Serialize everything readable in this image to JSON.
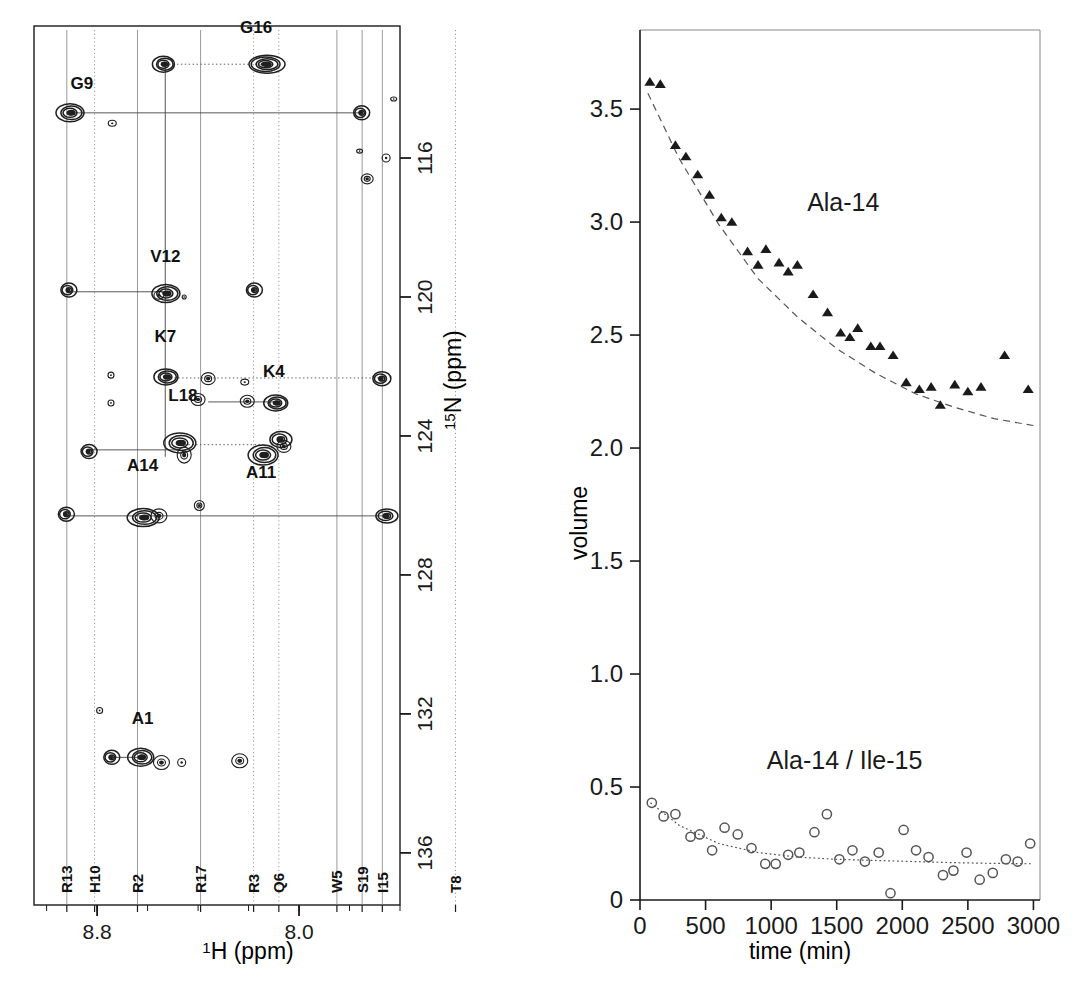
{
  "figure": {
    "background_color": "#ffffff",
    "ink_color": "#1a1a1a"
  },
  "nmr_panel": {
    "name": "2D 1H-15N HSQC spectrum",
    "x_axis": {
      "label_main": "H (ppm)",
      "label_superscript": "1",
      "ticks_major": [
        8.8,
        8.0
      ],
      "tick_labels": [
        "8.8",
        "8.0"
      ],
      "range": [
        9.05,
        7.6
      ],
      "direction": "reversed"
    },
    "y_axis": {
      "label_main": "N (ppm)",
      "label_superscript": "15",
      "ticks_major": [
        116,
        120,
        124,
        128,
        132,
        136
      ],
      "tick_labels": [
        "116",
        "120",
        "124",
        "128",
        "132",
        "136"
      ],
      "range": [
        112.2,
        137.5
      ],
      "direction": "reversed"
    },
    "peak_labels": [
      {
        "text": "G9",
        "h": 8.86,
        "n": 114.0
      },
      {
        "text": "G16",
        "h": 8.17,
        "n": 112.4
      },
      {
        "text": "V12",
        "h": 8.53,
        "n": 119.0
      },
      {
        "text": "K7",
        "h": 8.53,
        "n": 121.3
      },
      {
        "text": "K4",
        "h": 8.1,
        "n": 122.3
      },
      {
        "text": "L18",
        "h": 8.46,
        "n": 123.0
      },
      {
        "text": "A11",
        "h": 8.15,
        "n": 125.2
      },
      {
        "text": "A14",
        "h": 8.62,
        "n": 125.0
      },
      {
        "text": "A1",
        "h": 8.62,
        "n": 132.3
      }
    ],
    "residue_ticks": [
      {
        "label": "R13",
        "h": 8.92
      },
      {
        "label": "H10",
        "h": 8.81
      },
      {
        "label": "R2",
        "h": 8.64
      },
      {
        "label": "R17",
        "h": 8.39
      },
      {
        "label": "R3",
        "h": 8.18
      },
      {
        "label": "Q6",
        "h": 8.08
      },
      {
        "label": "W5",
        "h": 7.85
      },
      {
        "label": "S19",
        "h": 7.75
      },
      {
        "label": "I15",
        "h": 7.67
      },
      {
        "label": "T8",
        "h": 7.38
      }
    ],
    "cross_peaks": [
      {
        "id": "G9",
        "h": 8.905,
        "n": 114.7,
        "rx": 14,
        "ry": 9,
        "rings": 4
      },
      {
        "id": "G9-pair",
        "h": 8.535,
        "n": 113.3,
        "rx": 11,
        "ry": 8,
        "rings": 4
      },
      {
        "id": "G16",
        "h": 8.13,
        "n": 113.3,
        "rx": 18,
        "ry": 9,
        "rings": 5
      },
      {
        "id": "G16-pair",
        "h": 7.755,
        "n": 114.7,
        "rx": 8,
        "ry": 7,
        "rings": 3
      },
      {
        "id": "aux-1",
        "h": 8.74,
        "n": 115.0,
        "rx": 4,
        "ry": 3,
        "rings": 1
      },
      {
        "id": "aux-2",
        "h": 7.73,
        "n": 116.6,
        "rx": 6,
        "ry": 5,
        "rings": 2
      },
      {
        "id": "aux-3",
        "h": 7.76,
        "n": 115.8,
        "rx": 3,
        "ry": 2,
        "rings": 1
      },
      {
        "id": "aux-4",
        "h": 7.655,
        "n": 116.0,
        "rx": 4,
        "ry": 4,
        "rings": 1
      },
      {
        "id": "aux-5",
        "h": 7.625,
        "n": 114.3,
        "rx": 3,
        "ry": 2,
        "rings": 1
      },
      {
        "id": "V12",
        "h": 8.525,
        "n": 119.9,
        "rx": 14,
        "ry": 9,
        "rings": 4
      },
      {
        "id": "V12-pair",
        "h": 8.915,
        "n": 119.8,
        "rx": 8,
        "ry": 7,
        "rings": 3
      },
      {
        "id": "V12-aux",
        "h": 8.555,
        "n": 119.95,
        "rx": 5,
        "ry": 4,
        "rings": 1
      },
      {
        "id": "aux-6",
        "h": 8.18,
        "n": 119.8,
        "rx": 8,
        "ry": 7,
        "rings": 3
      },
      {
        "id": "aux-7",
        "h": 8.455,
        "n": 120.0,
        "rx": 2,
        "ry": 2,
        "rings": 1
      },
      {
        "id": "K7",
        "h": 8.525,
        "n": 122.3,
        "rx": 12,
        "ry": 8,
        "rings": 4
      },
      {
        "id": "K7-b",
        "h": 8.36,
        "n": 122.35,
        "rx": 7,
        "ry": 6,
        "rings": 2
      },
      {
        "id": "K7-c",
        "h": 8.215,
        "n": 122.45,
        "rx": 4,
        "ry": 3,
        "rings": 1
      },
      {
        "id": "K7-d",
        "h": 7.675,
        "n": 122.35,
        "rx": 9,
        "ry": 7,
        "rings": 3
      },
      {
        "id": "aux-8",
        "h": 8.745,
        "n": 122.25,
        "rx": 3,
        "ry": 3,
        "rings": 1
      },
      {
        "id": "aux-9",
        "h": 8.745,
        "n": 123.05,
        "rx": 3,
        "ry": 3,
        "rings": 1
      },
      {
        "id": "K4",
        "h": 8.09,
        "n": 123.05,
        "rx": 12,
        "ry": 8,
        "rings": 4
      },
      {
        "id": "K4-b",
        "h": 8.205,
        "n": 123.0,
        "rx": 7,
        "ry": 6,
        "rings": 2
      },
      {
        "id": "K4-c",
        "h": 8.4,
        "n": 122.95,
        "rx": 7,
        "ry": 6,
        "rings": 2
      },
      {
        "id": "L18",
        "h": 8.47,
        "n": 124.2,
        "rx": 16,
        "ry": 10,
        "rings": 4
      },
      {
        "id": "L18-b",
        "h": 8.455,
        "n": 124.55,
        "rx": 7,
        "ry": 8,
        "rings": 2
      },
      {
        "id": "L18-pair",
        "h": 8.835,
        "n": 124.45,
        "rx": 8,
        "ry": 7,
        "rings": 3
      },
      {
        "id": "A11",
        "h": 8.14,
        "n": 124.55,
        "rx": 15,
        "ry": 10,
        "rings": 4
      },
      {
        "id": "A11-b",
        "h": 8.075,
        "n": 124.1,
        "rx": 11,
        "ry": 8,
        "rings": 3
      },
      {
        "id": "A11-c",
        "h": 8.06,
        "n": 124.3,
        "rx": 7,
        "ry": 6,
        "rings": 2
      },
      {
        "id": "A14",
        "h": 8.615,
        "n": 126.35,
        "rx": 16,
        "ry": 9,
        "rings": 4
      },
      {
        "id": "A14-b",
        "h": 8.555,
        "n": 126.3,
        "rx": 8,
        "ry": 7,
        "rings": 2
      },
      {
        "id": "A14-pair",
        "h": 8.925,
        "n": 126.25,
        "rx": 8,
        "ry": 7,
        "rings": 3
      },
      {
        "id": "A14-r",
        "h": 7.655,
        "n": 126.3,
        "rx": 11,
        "ry": 7,
        "rings": 3
      },
      {
        "id": "aux-10",
        "h": 8.395,
        "n": 126.0,
        "rx": 5,
        "ry": 5,
        "rings": 2
      },
      {
        "id": "A1",
        "h": 8.625,
        "n": 133.25,
        "rx": 13,
        "ry": 9,
        "rings": 4
      },
      {
        "id": "A1-b",
        "h": 8.545,
        "n": 133.4,
        "rx": 8,
        "ry": 7,
        "rings": 2
      },
      {
        "id": "A1-pair",
        "h": 8.745,
        "n": 133.25,
        "rx": 8,
        "ry": 7,
        "rings": 3
      },
      {
        "id": "A1-r",
        "h": 8.235,
        "n": 133.35,
        "rx": 8,
        "ry": 7,
        "rings": 2
      },
      {
        "id": "aux-11",
        "h": 8.79,
        "n": 131.9,
        "rx": 3,
        "ry": 3,
        "rings": 1
      },
      {
        "id": "aux-12",
        "h": 8.465,
        "n": 133.4,
        "rx": 4,
        "ry": 4,
        "rings": 1
      }
    ],
    "connectivity_solid": [
      {
        "from_h": 8.905,
        "to_h": 7.755,
        "n": 114.7
      },
      {
        "from_h": 8.53,
        "to_h": 8.53,
        "n_from": 113.3,
        "n_to": 124.6,
        "vertical": true
      },
      {
        "from_h": 8.915,
        "to_h": 8.525,
        "n": 119.85
      },
      {
        "from_h": 8.36,
        "to_h": 8.09,
        "n": 123.02
      },
      {
        "from_h": 8.835,
        "to_h": 8.47,
        "n": 124.4
      },
      {
        "from_h": 8.925,
        "to_h": 7.655,
        "n": 126.3
      },
      {
        "from_h": 8.745,
        "to_h": 8.625,
        "n": 133.25
      }
    ],
    "connectivity_dotted": [
      {
        "from_h": 8.53,
        "to_h": 8.13,
        "n": 113.3
      },
      {
        "from_h": 8.525,
        "to_h": 7.675,
        "n": 122.33
      },
      {
        "from_h": 8.47,
        "to_h": 8.14,
        "n": 124.25
      }
    ]
  },
  "chart_data": {
    "type": "scatter",
    "title": "",
    "xlabel": "time (min)",
    "ylabel": "volume",
    "xlim": [
      0,
      3050
    ],
    "ylim": [
      0,
      3.85
    ],
    "xticks": [
      0,
      500,
      1000,
      1500,
      2000,
      2500,
      3000
    ],
    "xtick_labels": [
      "0",
      "500",
      "1000",
      "1500",
      "2000",
      "2500",
      "3000"
    ],
    "yticks": [
      0,
      0.5,
      1.0,
      1.5,
      2.0,
      2.5,
      3.0,
      3.5
    ],
    "ytick_labels": [
      "0",
      "0.5",
      "1.0",
      "1.5",
      "2.0",
      "2.5",
      "3.0",
      "3.5"
    ],
    "grid": false,
    "legend": "inline-annotations",
    "series": [
      {
        "name": "Ala-14",
        "marker": "filled-triangle",
        "color": "#1a1a1a",
        "annotation": "Ala-14",
        "annotation_x": 1550,
        "annotation_y": 3.05,
        "fit": {
          "style": "dashed",
          "type": "exponential-decay",
          "points": [
            [
              60,
              3.57
            ],
            [
              300,
              3.28
            ],
            [
              600,
              2.99
            ],
            [
              900,
              2.75
            ],
            [
              1200,
              2.58
            ],
            [
              1500,
              2.44
            ],
            [
              1800,
              2.33
            ],
            [
              2100,
              2.24
            ],
            [
              2400,
              2.18
            ],
            [
              2700,
              2.13
            ],
            [
              3000,
              2.1
            ]
          ]
        },
        "points": [
          [
            75,
            3.62
          ],
          [
            155,
            3.61
          ],
          [
            270,
            3.34
          ],
          [
            350,
            3.29
          ],
          [
            440,
            3.21
          ],
          [
            530,
            3.12
          ],
          [
            620,
            3.02
          ],
          [
            700,
            3.0
          ],
          [
            820,
            2.87
          ],
          [
            900,
            2.81
          ],
          [
            960,
            2.88
          ],
          [
            1060,
            2.82
          ],
          [
            1130,
            2.78
          ],
          [
            1200,
            2.81
          ],
          [
            1320,
            2.68
          ],
          [
            1430,
            2.6
          ],
          [
            1530,
            2.51
          ],
          [
            1600,
            2.49
          ],
          [
            1660,
            2.53
          ],
          [
            1760,
            2.45
          ],
          [
            1830,
            2.45
          ],
          [
            1930,
            2.41
          ],
          [
            2030,
            2.29
          ],
          [
            2130,
            2.26
          ],
          [
            2220,
            2.27
          ],
          [
            2290,
            2.19
          ],
          [
            2400,
            2.28
          ],
          [
            2500,
            2.25
          ],
          [
            2600,
            2.27
          ],
          [
            2780,
            2.41
          ],
          [
            2960,
            2.26
          ]
        ]
      },
      {
        "name": "Ala-14 / Ile-15",
        "marker": "open-circle",
        "color": "#555555",
        "annotation": "Ala-14 / Ile-15",
        "annotation_x": 1560,
        "annotation_y": 0.58,
        "fit": {
          "style": "dotted",
          "type": "exponential-decay",
          "points": [
            [
              80,
              0.43
            ],
            [
              300,
              0.33
            ],
            [
              600,
              0.25
            ],
            [
              900,
              0.21
            ],
            [
              1200,
              0.19
            ],
            [
              1500,
              0.18
            ],
            [
              1800,
              0.175
            ],
            [
              2100,
              0.17
            ],
            [
              2400,
              0.165
            ],
            [
              2700,
              0.162
            ],
            [
              3000,
              0.16
            ]
          ]
        },
        "points": [
          [
            90,
            0.43
          ],
          [
            180,
            0.37
          ],
          [
            270,
            0.38
          ],
          [
            385,
            0.28
          ],
          [
            455,
            0.29
          ],
          [
            550,
            0.22
          ],
          [
            645,
            0.32
          ],
          [
            745,
            0.29
          ],
          [
            850,
            0.23
          ],
          [
            955,
            0.16
          ],
          [
            1035,
            0.16
          ],
          [
            1130,
            0.2
          ],
          [
            1215,
            0.21
          ],
          [
            1330,
            0.3
          ],
          [
            1425,
            0.38
          ],
          [
            1520,
            0.18
          ],
          [
            1620,
            0.22
          ],
          [
            1715,
            0.17
          ],
          [
            1820,
            0.21
          ],
          [
            1910,
            0.03
          ],
          [
            2010,
            0.31
          ],
          [
            2105,
            0.22
          ],
          [
            2200,
            0.19
          ],
          [
            2310,
            0.11
          ],
          [
            2390,
            0.13
          ],
          [
            2490,
            0.21
          ],
          [
            2590,
            0.09
          ],
          [
            2690,
            0.12
          ],
          [
            2790,
            0.18
          ],
          [
            2880,
            0.17
          ],
          [
            2975,
            0.25
          ]
        ]
      }
    ]
  }
}
